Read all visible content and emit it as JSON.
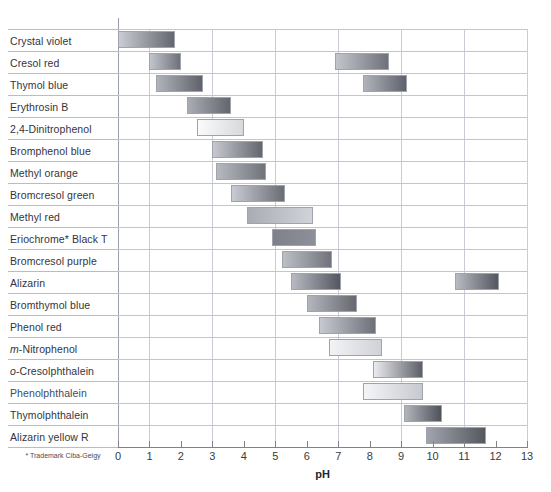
{
  "chart_data": {
    "type": "bar",
    "title": "",
    "xlabel": "pH",
    "ylabel": "",
    "xlim": [
      0,
      13
    ],
    "grid": "vertical gridlines at odd pH values, horizontal row separators",
    "legend": "none",
    "orientation": "horizontal",
    "x_ticks": [
      0,
      1,
      2,
      3,
      4,
      5,
      6,
      7,
      8,
      9,
      10,
      11,
      12,
      13
    ],
    "footnote": "* Trademark Ciba-Geigy",
    "categories": [
      "Crystal violet",
      "Cresol red",
      "Thymol blue",
      "Erythrosin B",
      "2,4-Dinitrophenol",
      "Bromphenol blue",
      "Methyl orange",
      "Bromcresol green",
      "Methyl red",
      "Eriochrome* Black T",
      "Bromcresol purple",
      "Alizarin",
      "Bromthymol blue",
      "Phenol red",
      "m-Nitrophenol",
      "o-Cresolphthalein",
      "Phenolphthalein",
      "Thymolphthalein",
      "Alizarin yellow R"
    ],
    "indicators": [
      {
        "name": "Crystal violet",
        "ranges": [
          [
            0.0,
            1.8
          ]
        ],
        "left_color": "#c9ccd2",
        "right_color": "#63666e"
      },
      {
        "name": "Cresol red",
        "ranges": [
          [
            1.0,
            2.0
          ],
          [
            6.9,
            8.6
          ]
        ],
        "left_color": "#c2c5cb",
        "right_color": "#6e7178"
      },
      {
        "name": "Thymol blue",
        "ranges": [
          [
            1.2,
            2.7
          ],
          [
            7.8,
            9.2
          ]
        ],
        "left_color": "#b0b3ba",
        "right_color": "#5f626a"
      },
      {
        "name": "Erythrosin B",
        "ranges": [
          [
            2.2,
            3.6
          ]
        ],
        "left_color": "#a9acb3",
        "right_color": "#63666e"
      },
      {
        "name": "2,4-Dinitrophenol",
        "ranges": [
          [
            2.5,
            4.0
          ]
        ],
        "left_color": "#fbfbfc",
        "right_color": "#d7d9dd"
      },
      {
        "name": "Bromphenol blue",
        "ranges": [
          [
            3.0,
            4.6
          ]
        ],
        "left_color": "#c6c9cf",
        "right_color": "#63666e"
      },
      {
        "name": "Methyl orange",
        "ranges": [
          [
            3.1,
            4.7
          ]
        ],
        "left_color": "#b6b9c0",
        "right_color": "#70737a"
      },
      {
        "name": "Bromcresol green",
        "ranges": [
          [
            3.6,
            5.3
          ]
        ],
        "left_color": "#c8cbd1",
        "right_color": "#6a6d74"
      },
      {
        "name": "Methyl red",
        "ranges": [
          [
            4.1,
            6.2
          ]
        ],
        "left_color": "#a9acb3",
        "right_color": "#d0d3d8"
      },
      {
        "name": "Eriochrome* Black T",
        "ranges": [
          [
            4.9,
            6.3
          ]
        ],
        "left_color": "#7e818a",
        "right_color": "#8d9098"
      },
      {
        "name": "Bromcresol purple",
        "ranges": [
          [
            5.2,
            6.8
          ]
        ],
        "left_color": "#bcbfc6",
        "right_color": "#70737b"
      },
      {
        "name": "Alizarin",
        "ranges": [
          [
            5.5,
            7.1
          ],
          [
            10.7,
            12.1
          ]
        ],
        "left_color": "#b7bac1",
        "right_color": "#54575f"
      },
      {
        "name": "Bromthymol blue",
        "ranges": [
          [
            6.0,
            7.6
          ]
        ],
        "left_color": "#b3b6bd",
        "right_color": "#65686f"
      },
      {
        "name": "Phenol red",
        "ranges": [
          [
            6.4,
            8.2
          ]
        ],
        "left_color": "#c6c9cf",
        "right_color": "#6d7078"
      },
      {
        "name": "m-Nitrophenol",
        "ranges": [
          [
            6.7,
            8.4
          ]
        ],
        "left_color": "#f2f3f5",
        "right_color": "#cfd2d7"
      },
      {
        "name": "o-Cresolphthalein",
        "ranges": [
          [
            8.1,
            9.7
          ]
        ],
        "left_color": "#eaebee",
        "right_color": "#5c5f67"
      },
      {
        "name": "Phenolphthalein",
        "ranges": [
          [
            7.8,
            9.7
          ]
        ],
        "left_color": "#f4f5f7",
        "right_color": "#c6c9cf"
      },
      {
        "name": "Thymolphthalein",
        "ranges": [
          [
            9.1,
            10.3
          ]
        ],
        "left_color": "#b2b5bc",
        "right_color": "#4f5259"
      },
      {
        "name": "Alizarin yellow R",
        "ranges": [
          [
            9.8,
            11.7
          ]
        ],
        "left_color": "#a1a4ac",
        "right_color": "#55585f"
      }
    ]
  }
}
